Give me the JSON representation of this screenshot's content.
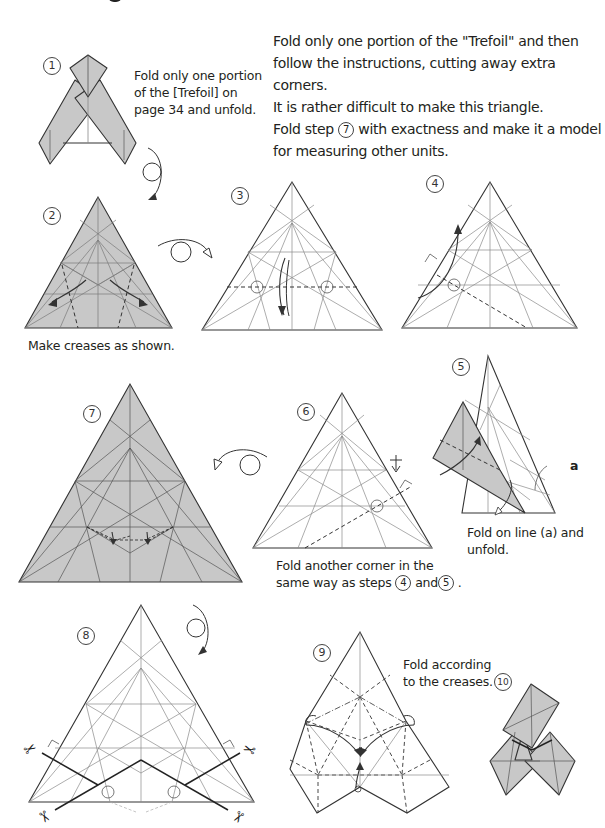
{
  "intro": {
    "lines": [
      "Fold only one portion of the \"Trefoil\" and then",
      "follow the instructions, cutting away extra corners.",
      "It is rather difficult to make this triangle.",
      "Fold step",
      "with exactness and make it a model",
      "for measuring other units."
    ],
    "inline_step": "7"
  },
  "steps": [
    {
      "num": "1",
      "caption_lines": [
        "Fold only one portion",
        "of the [Trefoil] on",
        "page 34 and unfold."
      ]
    },
    {
      "num": "2",
      "caption": "Make creases as shown."
    },
    {
      "num": "3"
    },
    {
      "num": "4"
    },
    {
      "num": "5",
      "label_a": "a",
      "caption_lines": [
        "Fold on line (a) and",
        "unfold."
      ]
    },
    {
      "num": "6",
      "caption_line1": "Fold another corner in the",
      "caption_line2_prefix": "same way as steps",
      "ref_a": "4",
      "and": "and",
      "ref_b": "5",
      "period": "."
    },
    {
      "num": "7"
    },
    {
      "num": "8"
    },
    {
      "num": "9",
      "caption_lines": [
        "Fold according",
        "to the creases."
      ]
    },
    {
      "num": "10"
    }
  ],
  "colors": {
    "paper_shaded": "#c8c8c8",
    "line_dark": "#333333",
    "crease": "#8a8a8a"
  }
}
